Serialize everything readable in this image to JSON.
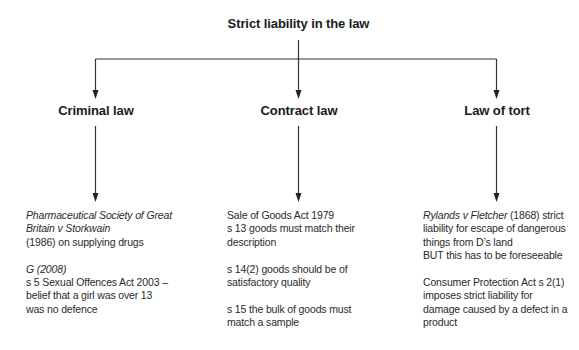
{
  "diagram": {
    "title": "Strict liability in the law",
    "branches": [
      {
        "heading": "Criminal law",
        "paragraphs": [
          {
            "lines": [
              {
                "text": "Pharmaceutical Society of Great",
                "italic": true
              },
              {
                "text": "Britain v Storkwain",
                "italic": true
              },
              {
                "text": "(1986) on supplying drugs",
                "italic": false
              }
            ]
          },
          {
            "lines": [
              {
                "text": "G (2008)",
                "italic": true
              },
              {
                "text": "s 5 Sexual Offences Act 2003 –",
                "italic": false
              },
              {
                "text": "belief that a girl was over 13",
                "italic": false
              },
              {
                "text": "was no defence",
                "italic": false
              }
            ]
          }
        ]
      },
      {
        "heading": "Contract law",
        "paragraphs": [
          {
            "lines": [
              {
                "text": "Sale of Goods Act 1979"
              },
              {
                "text": "s 13 goods must match their"
              },
              {
                "text": "description"
              }
            ]
          },
          {
            "lines": [
              {
                "text": "s 14(2) goods should be of"
              },
              {
                "text": "satisfactory quality"
              }
            ]
          },
          {
            "lines": [
              {
                "text": "s 15 the bulk of goods must"
              },
              {
                "text": "match a sample"
              }
            ]
          }
        ]
      },
      {
        "heading": "Law of tort",
        "paragraphs": [
          {
            "lines": [
              {
                "italic_part": "Rylands v Fletcher",
                "text": " (1868) strict"
              },
              {
                "text": "liability for escape of dangerous"
              },
              {
                "text": "things from D’s land"
              },
              {
                "text": "BUT this has to be foreseeable"
              }
            ]
          },
          {
            "lines": [
              {
                "text": "Consumer Protection Act s 2(1)"
              },
              {
                "text": "imposes strict liability for"
              },
              {
                "text": "damage caused by a defect in a"
              },
              {
                "text": "product"
              }
            ]
          }
        ]
      }
    ],
    "line_color": "#333333"
  }
}
